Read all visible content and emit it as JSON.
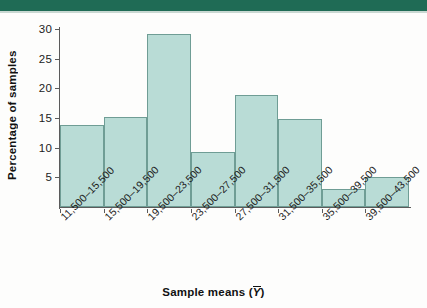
{
  "figure": {
    "background_color": "#fdfdfc",
    "band_color": "#1f6b55"
  },
  "chart_data": {
    "type": "bar",
    "title": "",
    "xlabel": "Sample means (Ȳ)",
    "ylabel": "Percentage of samples",
    "categories": [
      "11,500–15,500",
      "15,500–19,500",
      "19,500–23,500",
      "23,500–27,500",
      "27,500–31,500",
      "31,500–35,500",
      "35,500–39,500",
      "39,500–43,500"
    ],
    "values": [
      13.8,
      15.2,
      29.2,
      9.2,
      18.8,
      14.9,
      3.0,
      5.1
    ],
    "ylim": [
      0,
      30
    ],
    "yticks": [
      5,
      10,
      15,
      20,
      25,
      30
    ],
    "ytick_labels": [
      "5",
      "10",
      "15",
      "20",
      "25",
      "30"
    ],
    "grid": false,
    "legend": null,
    "bar_fill_color": "#b9dcd6",
    "bar_edge_color": "#6f9d95",
    "axis_color": "#5b5b5b"
  },
  "axis_titles": {
    "x_prefix": "Sample means (",
    "x_symbol": "Y",
    "x_suffix": ")",
    "y": "Percentage of samples"
  }
}
